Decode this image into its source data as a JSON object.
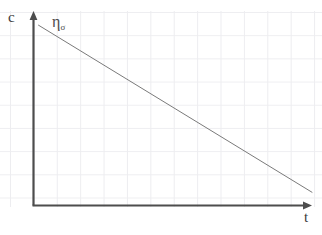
{
  "figure": {
    "background_color": "#ffffff",
    "width": 322,
    "height": 235
  },
  "axes": {
    "y_axis_label": "c",
    "x_axis_label": "t",
    "axis_color": "#4d4d4d",
    "grid_color": "#ededf0",
    "grid_visible": true,
    "y_arrow": "arrow-up",
    "x_arrow": "arrow-right"
  },
  "annotations": {
    "curve_label_base": "η",
    "curve_label_subscript": "σ"
  },
  "caption": {
    "cut_off_text": ""
  },
  "chart_data": {
    "type": "line",
    "title": "",
    "xlabel": "t",
    "ylabel": "c",
    "grid": true,
    "legend_position": "inline-annotation",
    "xlim": [
      0,
      1
    ],
    "ylim": [
      0,
      1
    ],
    "axis_ticks": [],
    "series": [
      {
        "name": "ησ",
        "label": "η_σ",
        "color": "#7a7a7a",
        "line_width": 1,
        "x": [
          0.018,
          1.0
        ],
        "y": [
          0.927,
          0.068
        ],
        "points": [
          {
            "x": 0.018,
            "y": 0.927
          },
          {
            "x": 1.0,
            "y": 0.068
          }
        ],
        "description": "linear decrease of concentration c with time t"
      }
    ]
  }
}
